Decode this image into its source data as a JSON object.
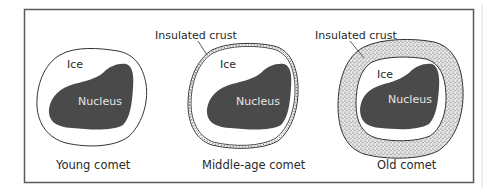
{
  "diagram": {
    "title": "",
    "colors": {
      "frame": "#5a5a5a",
      "nucleus_fill": "#4a4a4a",
      "nucleus_text": "#e6e6e6",
      "outline": "#333333",
      "crust_fill": "#d8d8d8",
      "text": "#2a2a2a"
    },
    "panels": [
      {
        "id": "young",
        "caption": "Young comet",
        "labels": {
          "ice": "Ice",
          "nucleus": "Nucleus"
        }
      },
      {
        "id": "middle",
        "caption": "Middle-age comet",
        "labels": {
          "crust": "Insulated crust",
          "ice": "Ice",
          "nucleus": "Nucleus"
        }
      },
      {
        "id": "old",
        "caption": "Old comet",
        "labels": {
          "crust": "Insulated crust",
          "ice": "Ice",
          "nucleus": "Nucleus"
        }
      }
    ]
  }
}
